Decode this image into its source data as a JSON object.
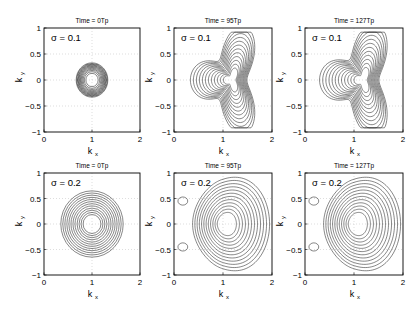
{
  "chart_data": [
    {
      "type": "contour",
      "title": "Time = 0Tp",
      "annotation": "σ = 0.1",
      "sigma": 0.1,
      "time_label": "0Tp",
      "shape": "circle",
      "outer_radius": 0.33,
      "levels": 12,
      "center": [
        1,
        0
      ],
      "xlabel": "k",
      "xlabel_sub": "x",
      "ylabel": "k",
      "ylabel_sub": "y",
      "xlim": [
        0,
        2
      ],
      "ylim": [
        -1,
        1
      ],
      "xticks": [
        "0",
        "1",
        "2"
      ],
      "yticks": [
        "1",
        "0.5",
        "0",
        "-0.5",
        "-1"
      ],
      "grid": "dotted"
    },
    {
      "type": "contour",
      "title": "Time = 95Tp",
      "annotation": "σ = 0.1",
      "sigma": 0.1,
      "time_label": "95Tp",
      "shape": "star",
      "levels": 12,
      "xlabel": "k",
      "xlabel_sub": "x",
      "ylabel": "k",
      "ylabel_sub": "y",
      "xlim": [
        0,
        2
      ],
      "ylim": [
        -1,
        1
      ],
      "xticks": [
        "0",
        "1",
        "2"
      ],
      "yticks": [
        "1",
        "0.5",
        "0",
        "-0.5",
        "-1"
      ],
      "grid": "dotted"
    },
    {
      "type": "contour",
      "title": "Time = 127Tp",
      "annotation": "σ = 0.1",
      "sigma": 0.1,
      "time_label": "127Tp",
      "shape": "star",
      "levels": 12,
      "xlabel": "k",
      "xlabel_sub": "x",
      "ylabel": "k",
      "ylabel_sub": "y",
      "xlim": [
        0,
        2
      ],
      "ylim": [
        -1,
        1
      ],
      "xticks": [
        "0",
        "1",
        "2"
      ],
      "yticks": [
        "1",
        "0.5",
        "0",
        "-0.5",
        "-1"
      ],
      "grid": "dotted"
    },
    {
      "type": "contour",
      "title": "Time = 0Tp",
      "annotation": "σ = 0.2",
      "sigma": 0.2,
      "time_label": "0Tp",
      "shape": "circle",
      "outer_radius": 0.65,
      "levels": 12,
      "center": [
        1,
        0
      ],
      "xlabel": "k",
      "xlabel_sub": "x",
      "ylabel": "k",
      "ylabel_sub": "y",
      "xlim": [
        0,
        2
      ],
      "ylim": [
        -1,
        1
      ],
      "xticks": [
        "0",
        "1",
        "2"
      ],
      "yticks": [
        "1",
        "0.5",
        "0",
        "-0.5",
        "-1"
      ],
      "grid": "dotted"
    },
    {
      "type": "contour",
      "title": "Time = 95Tp",
      "annotation": "σ = 0.2",
      "sigma": 0.2,
      "time_label": "95Tp",
      "shape": "fan",
      "levels": 12,
      "xlabel": "k",
      "xlabel_sub": "x",
      "ylabel": "k",
      "ylabel_sub": "y",
      "xlim": [
        0,
        2
      ],
      "ylim": [
        -1,
        1
      ],
      "xticks": [
        "0",
        "1",
        "2"
      ],
      "yticks": [
        "1",
        "0.5",
        "0",
        "-0.5",
        "-1"
      ],
      "grid": "dotted"
    },
    {
      "type": "contour",
      "title": "Time = 127Tp",
      "annotation": "σ = 0.2",
      "sigma": 0.2,
      "time_label": "127Tp",
      "shape": "fan",
      "levels": 12,
      "xlabel": "k",
      "xlabel_sub": "x",
      "ylabel": "k",
      "ylabel_sub": "y",
      "xlim": [
        0,
        2
      ],
      "ylim": [
        -1,
        1
      ],
      "xticks": [
        "0",
        "1",
        "2"
      ],
      "yticks": [
        "1",
        "0.5",
        "0",
        "-0.5",
        "-1"
      ],
      "grid": "dotted"
    }
  ]
}
